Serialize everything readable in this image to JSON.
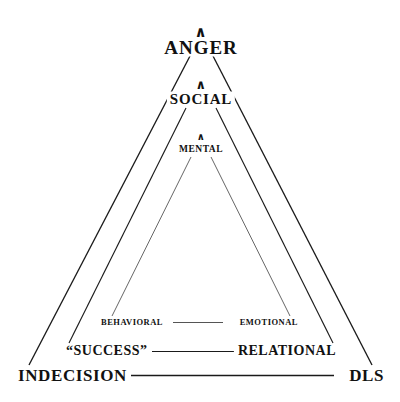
{
  "figure": {
    "type": "nested-triangle-hierarchy-diagram",
    "background_color": "#ffffff",
    "stroke_color": "#1a1a1a",
    "text_color": "#111111",
    "width": 400,
    "height": 402
  },
  "apex_labels": {
    "outer": "ANGER",
    "middle": "SOCIAL",
    "inner": "MENTAL"
  },
  "caret_glyph": "∧",
  "base_rows": [
    {
      "id": "inner-base",
      "left_label": "BEHAVIORAL",
      "right_label": "EMOTIONAL"
    },
    {
      "id": "middle-base",
      "left_label": "“SUCCESS”",
      "right_label": "RELATIONAL"
    },
    {
      "id": "outer-base",
      "left_label": "INDECISION",
      "right_label": "DLS"
    }
  ],
  "triangles": [
    {
      "name": "outer-triangle",
      "apex_label": "ANGER",
      "left_base_label": "INDECISION",
      "right_base_label": "DLS"
    },
    {
      "name": "middle-triangle",
      "apex_label": "SOCIAL",
      "left_base_label": "“SUCCESS”",
      "right_base_label": "RELATIONAL"
    },
    {
      "name": "inner-triangle",
      "apex_label": "MENTAL",
      "left_base_label": "BEHAVIORAL",
      "right_base_label": "EMOTIONAL"
    }
  ]
}
